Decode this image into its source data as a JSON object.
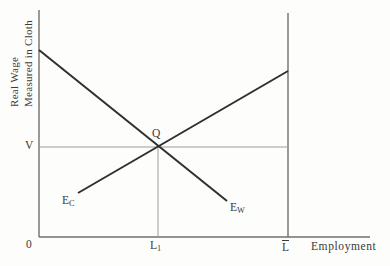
{
  "figure": {
    "y_axis_title_line1": "Real Wage",
    "y_axis_title_line2": "Measured in Cloth",
    "x_axis_label": "Employment",
    "origin_label": "0",
    "wage_label": "V",
    "equilibrium_label": "Q",
    "labels": {
      "l1": {
        "base": "L",
        "sub": "1"
      },
      "lbar": {
        "base": "L"
      },
      "ec": {
        "base": "E",
        "sub": "C"
      },
      "ew": {
        "base": "E",
        "sub": "W"
      }
    },
    "colors": {
      "curve": "#2f2f2f",
      "axis": "#6f6f6f",
      "guide": "#9c9c9c",
      "text": "#3a3a3a",
      "background": "#fdfdfb"
    },
    "lines": [
      {
        "name": "y-axis",
        "x1": 39,
        "y1": 10,
        "x2": 39,
        "y2": 237,
        "stroke": "axis",
        "width": 1.4
      },
      {
        "name": "x-axis",
        "x1": 39,
        "y1": 237,
        "x2": 370,
        "y2": 237,
        "stroke": "axis",
        "width": 1.4
      },
      {
        "name": "total-labor-line",
        "x1": 288,
        "y1": 13,
        "x2": 288,
        "y2": 237,
        "stroke": "axis",
        "width": 1.4
      },
      {
        "name": "wage-guide-line",
        "x1": 39,
        "y1": 147,
        "x2": 288,
        "y2": 147,
        "stroke": "guide",
        "width": 1
      },
      {
        "name": "employment-guide-line",
        "x1": 158,
        "y1": 147,
        "x2": 158,
        "y2": 237,
        "stroke": "guide",
        "width": 1
      },
      {
        "name": "ew-labor-demand-curve",
        "x1": 39,
        "y1": 50,
        "x2": 227,
        "y2": 201,
        "stroke": "curve",
        "width": 2
      },
      {
        "name": "ec-labor-demand-curve",
        "x1": 78,
        "y1": 193,
        "x2": 288,
        "y2": 71,
        "stroke": "curve",
        "width": 2
      }
    ]
  }
}
